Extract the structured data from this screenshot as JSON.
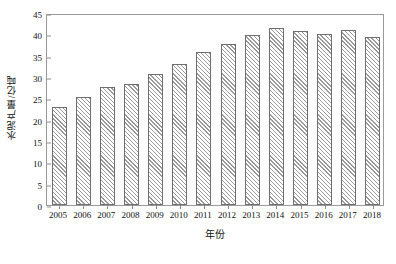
{
  "chart_data": {
    "type": "bar",
    "title": "",
    "subtitle": "",
    "xlabel": "年份",
    "ylabel": "水泥产量/亿吨",
    "categories": [
      "2005",
      "2006",
      "2007",
      "2008",
      "2009",
      "2010",
      "2011",
      "2012",
      "2013",
      "2014",
      "2015",
      "2016",
      "2017",
      "2018"
    ],
    "values": [
      23.0,
      25.4,
      27.6,
      28.3,
      30.6,
      33.0,
      35.9,
      37.8,
      39.9,
      41.4,
      40.7,
      40.0,
      41.0,
      39.4
    ],
    "series": [
      {
        "name": "水泥产量",
        "values": [
          23.0,
          25.4,
          27.6,
          28.3,
          30.6,
          33.0,
          35.9,
          37.8,
          39.9,
          41.4,
          40.7,
          40.0,
          41.0,
          39.4
        ]
      }
    ],
    "ylim": [
      0,
      45
    ],
    "yticks": [
      0,
      5,
      10,
      15,
      20,
      25,
      30,
      35,
      40,
      45
    ],
    "ytick_labels": [
      "0",
      "5",
      "10",
      "15",
      "20",
      "25",
      "30",
      "35",
      "40",
      "45"
    ],
    "grid": false,
    "legend": null,
    "legend_position": "none",
    "annotations": [],
    "bar_fill": "#ffffff",
    "bar_hatch": "diagonal-45",
    "bar_edge_color": "#6f6f6f",
    "frame_color": "#9a9a9a",
    "text_color": "#111111"
  }
}
